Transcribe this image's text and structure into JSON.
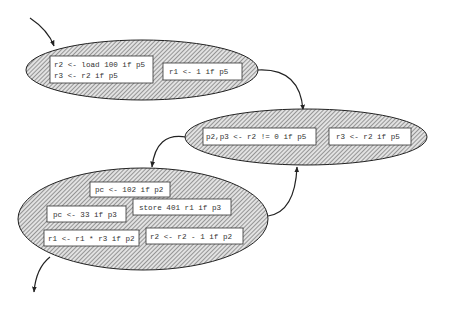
{
  "diagram": {
    "type": "dataflow-graph",
    "colors": {
      "stroke": "#222222",
      "hatch": "#555555",
      "ellipse_fill": "#cfcfcf",
      "box_fill": "#ffffff",
      "text": "#333333"
    },
    "nodes": [
      {
        "id": "block1",
        "boxes": [
          {
            "lines": [
              "r2 <- load 100 if p5",
              "r3 <- r2 if p5"
            ]
          },
          {
            "lines": [
              "r1 <- 1 if p5"
            ]
          }
        ]
      },
      {
        "id": "block2",
        "boxes": [
          {
            "lines": [
              "p2,p3 <- r2 != 0 if p5"
            ]
          },
          {
            "lines": [
              "r3 <- r2 if p5"
            ]
          }
        ]
      },
      {
        "id": "block3",
        "boxes": [
          {
            "lines": [
              "pc <- 102 if p2"
            ]
          },
          {
            "lines": [
              "store 401 r1 if p3"
            ]
          },
          {
            "lines": [
              "pc <- 33 if p3"
            ]
          },
          {
            "lines": [
              "r1 <- r1 * r3 if p2"
            ]
          },
          {
            "lines": [
              "r2 <- r2 - 1 if p2"
            ]
          }
        ]
      }
    ],
    "edges": [
      {
        "from": "entry",
        "to": "block1"
      },
      {
        "from": "block1",
        "to": "block2"
      },
      {
        "from": "block2",
        "to": "block3"
      },
      {
        "from": "block3",
        "to": "block2"
      },
      {
        "from": "block3",
        "to": "exit"
      }
    ]
  }
}
